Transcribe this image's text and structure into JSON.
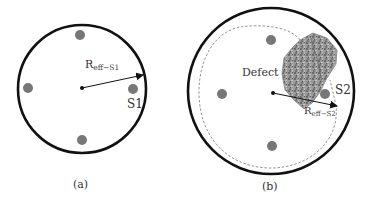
{
  "panels": [
    {
      "id": "a",
      "caption": "(a)",
      "radius_label_main": "R",
      "radius_label_sub": "eff−S1",
      "sensor_label": "S1",
      "circle": {
        "cx": 82,
        "cy": 89,
        "r": 64
      },
      "sources": [
        {
          "cx": 80,
          "cy": 35
        },
        {
          "cx": 28,
          "cy": 88
        },
        {
          "cx": 133,
          "cy": 89
        },
        {
          "cx": 82,
          "cy": 140
        }
      ]
    },
    {
      "id": "b",
      "caption": "(b)",
      "radius_label_main": "R",
      "radius_label_sub": "eff−S2",
      "sensor_label": "S2",
      "defect_label": "Defect",
      "circle": {
        "cx": 271,
        "cy": 91,
        "r": 83
      },
      "sources": [
        {
          "cx": 271,
          "cy": 40
        },
        {
          "cx": 222,
          "cy": 94
        },
        {
          "cx": 325,
          "cy": 94
        },
        {
          "cx": 272,
          "cy": 146
        }
      ]
    }
  ],
  "colors": {
    "outline": "#111111",
    "source_dot": "#777777",
    "defect_fill": "#8a8a8a",
    "dashed": "#888888",
    "text": "#333333"
  }
}
